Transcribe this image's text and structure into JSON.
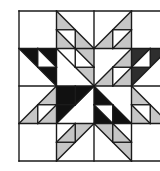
{
  "grid": {
    "origin_x": 19,
    "origin_y": 11,
    "cell_size": 37.5,
    "cols": 4,
    "rows": 4,
    "line_color": "#1a1a1a",
    "line_width": 1.4
  },
  "colors": {
    "background": "#ffffff",
    "light_gray": "#c6c6c6",
    "black": "#111111",
    "dark_gray": "#2e2e2e",
    "white": "#ffffff"
  },
  "shapes": [
    {
      "fill": "light_gray",
      "points": [
        [
          1,
          0
        ],
        [
          1.5,
          0.5
        ],
        [
          1,
          0.5
        ]
      ]
    },
    {
      "fill": "light_gray",
      "points": [
        [
          1,
          0.5
        ],
        [
          1.5,
          1
        ],
        [
          1,
          1
        ]
      ]
    },
    {
      "fill": "light_gray",
      "points": [
        [
          1.5,
          0.5
        ],
        [
          2,
          1
        ],
        [
          1.5,
          1
        ]
      ]
    },
    {
      "fill": "light_gray",
      "points": [
        [
          3,
          0
        ],
        [
          3,
          0.5
        ],
        [
          2.5,
          0.5
        ]
      ]
    },
    {
      "fill": "light_gray",
      "points": [
        [
          2.5,
          0.5
        ],
        [
          2.5,
          1
        ],
        [
          2,
          1
        ]
      ]
    },
    {
      "fill": "light_gray",
      "points": [
        [
          3,
          0.5
        ],
        [
          3,
          1
        ],
        [
          2.5,
          1
        ]
      ]
    },
    {
      "fill": "black",
      "points": [
        [
          0,
          1
        ],
        [
          0.5,
          1
        ],
        [
          0.5,
          1.5
        ]
      ]
    },
    {
      "fill": "black",
      "points": [
        [
          0.5,
          1
        ],
        [
          1,
          1
        ],
        [
          1,
          1.5
        ]
      ]
    },
    {
      "fill": "black",
      "points": [
        [
          0.5,
          1.5
        ],
        [
          1,
          1.5
        ],
        [
          1,
          2
        ]
      ]
    },
    {
      "fill": "light_gray",
      "points": [
        [
          1.5,
          1.5
        ],
        [
          2,
          1.5
        ],
        [
          2,
          2
        ]
      ]
    },
    {
      "fill": "light_gray",
      "points": [
        [
          1.5,
          1
        ],
        [
          2,
          1
        ],
        [
          2,
          1.5
        ]
      ]
    },
    {
      "fill": "light_gray",
      "points": [
        [
          3,
          1
        ],
        [
          3,
          1.5
        ],
        [
          2.5,
          1.5
        ]
      ]
    },
    {
      "fill": "light_gray",
      "points": [
        [
          2.5,
          1.5
        ],
        [
          2.5,
          2
        ],
        [
          2,
          2
        ]
      ]
    },
    {
      "fill": "light_gray",
      "points": [
        [
          3,
          1.5
        ],
        [
          3,
          2
        ],
        [
          2.5,
          2
        ]
      ]
    },
    {
      "fill": "dark_gray",
      "points": [
        [
          3,
          1
        ],
        [
          3.5,
          1
        ],
        [
          3,
          1.5
        ]
      ]
    },
    {
      "fill": "dark_gray",
      "points": [
        [
          3.5,
          1
        ],
        [
          4,
          1
        ],
        [
          3.5,
          1.5
        ]
      ]
    },
    {
      "fill": "dark_gray",
      "points": [
        [
          3,
          1.5
        ],
        [
          3.5,
          1.5
        ],
        [
          3,
          2
        ]
      ]
    },
    {
      "fill": "dark_gray",
      "points": [
        [
          4,
          1
        ],
        [
          4.2,
          1
        ],
        [
          4.2,
          1.2
        ]
      ]
    },
    {
      "fill": "light_gray",
      "points": [
        [
          1,
          2
        ],
        [
          1,
          2.5
        ],
        [
          0.5,
          2.5
        ]
      ]
    },
    {
      "fill": "light_gray",
      "points": [
        [
          0.5,
          2.5
        ],
        [
          0.5,
          3
        ],
        [
          0,
          3
        ]
      ]
    },
    {
      "fill": "light_gray",
      "points": [
        [
          1,
          2.5
        ],
        [
          1,
          3
        ],
        [
          0.5,
          3
        ]
      ]
    },
    {
      "fill": "black",
      "points": [
        [
          1,
          2
        ],
        [
          1.5,
          2
        ],
        [
          1.5,
          2.5
        ],
        [
          1,
          2.5
        ]
      ]
    },
    {
      "fill": "black",
      "points": [
        [
          1.5,
          2
        ],
        [
          2,
          2
        ],
        [
          1.5,
          2.5
        ]
      ]
    },
    {
      "fill": "black",
      "points": [
        [
          1,
          2.5
        ],
        [
          1.5,
          2.5
        ],
        [
          1,
          3
        ]
      ]
    },
    {
      "fill": "black",
      "points": [
        [
          2,
          2
        ],
        [
          2.5,
          2.5
        ],
        [
          2,
          2.5
        ]
      ]
    },
    {
      "fill": "black",
      "points": [
        [
          2,
          2.5
        ],
        [
          2.5,
          3
        ],
        [
          2,
          3
        ]
      ]
    },
    {
      "fill": "black",
      "points": [
        [
          2.5,
          2.5
        ],
        [
          3,
          3
        ],
        [
          2.5,
          3
        ]
      ]
    },
    {
      "fill": "light_gray",
      "points": [
        [
          3,
          2
        ],
        [
          3.5,
          2.5
        ],
        [
          3,
          2.5
        ]
      ]
    },
    {
      "fill": "light_gray",
      "points": [
        [
          3,
          2.5
        ],
        [
          3.5,
          3
        ],
        [
          3,
          3
        ]
      ]
    },
    {
      "fill": "light_gray",
      "points": [
        [
          3.5,
          2.5
        ],
        [
          4,
          3
        ],
        [
          3.5,
          3
        ]
      ]
    },
    {
      "fill": "light_gray",
      "points": [
        [
          1.5,
          3
        ],
        [
          2,
          3
        ],
        [
          1.5,
          3.5
        ]
      ]
    },
    {
      "fill": "light_gray",
      "points": [
        [
          1.5,
          3
        ],
        [
          1.5,
          3.5
        ],
        [
          1,
          3.5
        ]
      ]
    },
    {
      "fill": "light_gray",
      "points": [
        [
          1,
          3.5
        ],
        [
          1.5,
          3.5
        ],
        [
          1,
          4
        ]
      ]
    },
    {
      "fill": "light_gray",
      "points": [
        [
          2,
          3
        ],
        [
          2.5,
          3
        ],
        [
          2.5,
          3.5
        ]
      ]
    },
    {
      "fill": "light_gray",
      "points": [
        [
          2.5,
          3
        ],
        [
          3,
          3.5
        ],
        [
          2.5,
          3.5
        ]
      ]
    },
    {
      "fill": "light_gray",
      "points": [
        [
          2.5,
          3.5
        ],
        [
          3,
          3.5
        ],
        [
          3,
          4
        ]
      ]
    }
  ],
  "lines": [
    [
      [
        1,
        0
      ],
      [
        2,
        1
      ]
    ],
    [
      [
        1,
        0.5
      ],
      [
        1.5,
        0.5
      ]
    ],
    [
      [
        1.5,
        0.5
      ],
      [
        1.5,
        1
      ]
    ],
    [
      [
        1,
        0.5
      ],
      [
        1.5,
        1
      ]
    ],
    [
      [
        3,
        0
      ],
      [
        2,
        1
      ]
    ],
    [
      [
        2.5,
        0.5
      ],
      [
        3,
        0.5
      ]
    ],
    [
      [
        2.5,
        0.5
      ],
      [
        2.5,
        1
      ]
    ],
    [
      [
        3,
        0.5
      ],
      [
        2.5,
        1
      ]
    ],
    [
      [
        0,
        1
      ],
      [
        1,
        2
      ]
    ],
    [
      [
        0.5,
        1
      ],
      [
        0.5,
        1.5
      ]
    ],
    [
      [
        0.5,
        1.5
      ],
      [
        1,
        1.5
      ]
    ],
    [
      [
        0.5,
        1
      ],
      [
        1,
        1.5
      ]
    ],
    [
      [
        1,
        1
      ],
      [
        2,
        2
      ]
    ],
    [
      [
        1.5,
        1
      ],
      [
        1.5,
        1.5
      ]
    ],
    [
      [
        1.5,
        1.5
      ],
      [
        2,
        1.5
      ]
    ],
    [
      [
        1.5,
        1
      ],
      [
        2,
        1.5
      ]
    ],
    [
      [
        3,
        1
      ],
      [
        2,
        2
      ]
    ],
    [
      [
        2.5,
        1.5
      ],
      [
        3,
        1.5
      ]
    ],
    [
      [
        2.5,
        1.5
      ],
      [
        2.5,
        2
      ]
    ],
    [
      [
        3,
        1.5
      ],
      [
        2.5,
        2
      ]
    ],
    [
      [
        4,
        1
      ],
      [
        3,
        2
      ]
    ],
    [
      [
        3.5,
        1
      ],
      [
        3.5,
        1.5
      ]
    ],
    [
      [
        3,
        1.5
      ],
      [
        3.5,
        1.5
      ]
    ],
    [
      [
        3.5,
        1
      ],
      [
        3,
        1.5
      ]
    ],
    [
      [
        1,
        2
      ],
      [
        0,
        3
      ]
    ],
    [
      [
        0.5,
        2.5
      ],
      [
        1,
        2.5
      ]
    ],
    [
      [
        0.5,
        2.5
      ],
      [
        0.5,
        3
      ]
    ],
    [
      [
        1,
        2.5
      ],
      [
        0.5,
        3
      ]
    ],
    [
      [
        2,
        2
      ],
      [
        1,
        3
      ]
    ],
    [
      [
        1.5,
        2
      ],
      [
        1.5,
        2.5
      ]
    ],
    [
      [
        1,
        2.5
      ],
      [
        1.5,
        2.5
      ]
    ],
    [
      [
        1.5,
        2.5
      ],
      [
        2,
        2
      ]
    ],
    [
      [
        2,
        2
      ],
      [
        3,
        3
      ]
    ],
    [
      [
        2,
        2.5
      ],
      [
        2.5,
        2.5
      ]
    ],
    [
      [
        2.5,
        2.5
      ],
      [
        2.5,
        3
      ]
    ],
    [
      [
        2,
        2.5
      ],
      [
        2.5,
        3
      ]
    ],
    [
      [
        3,
        2
      ],
      [
        4,
        3
      ]
    ],
    [
      [
        3,
        2.5
      ],
      [
        3.5,
        2.5
      ]
    ],
    [
      [
        3.5,
        2.5
      ],
      [
        3.5,
        3
      ]
    ],
    [
      [
        3,
        2.5
      ],
      [
        3.5,
        3
      ]
    ],
    [
      [
        2,
        3
      ],
      [
        1,
        4
      ]
    ],
    [
      [
        1.5,
        3
      ],
      [
        1.5,
        3.5
      ]
    ],
    [
      [
        1,
        3.5
      ],
      [
        1.5,
        3.5
      ]
    ],
    [
      [
        1.5,
        3
      ],
      [
        1,
        3.5
      ]
    ],
    [
      [
        2,
        3
      ],
      [
        3,
        4
      ]
    ],
    [
      [
        2.5,
        3
      ],
      [
        2.5,
        3.5
      ]
    ],
    [
      [
        2.5,
        3.5
      ],
      [
        3,
        3.5
      ]
    ],
    [
      [
        2.5,
        3
      ],
      [
        3,
        3.5
      ]
    ]
  ]
}
